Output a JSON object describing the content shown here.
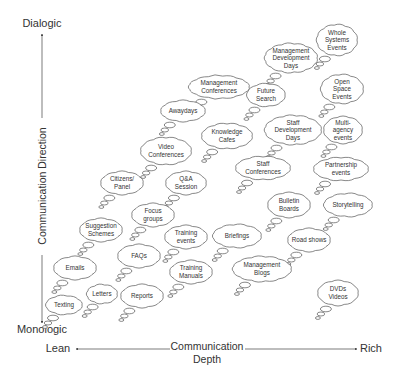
{
  "y_axis": {
    "top_label": "Dialogic",
    "bottom_label": "Monologic",
    "title": "Communication Direction"
  },
  "x_axis": {
    "left_label": "Lean",
    "right_label": "Rich",
    "title_line1": "Communication",
    "title_line2": "Depth"
  },
  "clouds": [
    {
      "id": "whole-systems-events",
      "lines": [
        "Whole",
        "Systems",
        "Events"
      ]
    },
    {
      "id": "management-development-days",
      "lines": [
        "Management",
        "Development",
        "Days"
      ]
    },
    {
      "id": "management-conferences",
      "lines": [
        "Management",
        "Conferences"
      ]
    },
    {
      "id": "open-space-events",
      "lines": [
        "Open",
        "Space",
        "Events"
      ]
    },
    {
      "id": "future-search",
      "lines": [
        "Future",
        "Search"
      ]
    },
    {
      "id": "awaydays",
      "lines": [
        "Awaydays"
      ]
    },
    {
      "id": "knowledge-cafes",
      "lines": [
        "Knowledge",
        "Cafes"
      ]
    },
    {
      "id": "staff-development-days",
      "lines": [
        "Staff",
        "Development",
        "Days"
      ]
    },
    {
      "id": "multi-agency-events",
      "lines": [
        "Multi-",
        "agency",
        "events"
      ]
    },
    {
      "id": "video-conferences",
      "lines": [
        "Video",
        "Conferences"
      ]
    },
    {
      "id": "staff-conferences",
      "lines": [
        "Staff",
        "Conferences"
      ]
    },
    {
      "id": "partnership-events",
      "lines": [
        "Partnership",
        "events"
      ]
    },
    {
      "id": "citizens-panel",
      "lines": [
        "Citizens/",
        "Panel"
      ]
    },
    {
      "id": "qa-session",
      "lines": [
        "Q&A",
        "Session"
      ]
    },
    {
      "id": "focus-groups",
      "lines": [
        "Focus",
        "groups"
      ]
    },
    {
      "id": "bulletin-boards",
      "lines": [
        "Bulletin",
        "Boards"
      ]
    },
    {
      "id": "storytelling",
      "lines": [
        "Storytelling"
      ]
    },
    {
      "id": "suggestion-schemes",
      "lines": [
        "Suggestion",
        "Schemes"
      ]
    },
    {
      "id": "training-events",
      "lines": [
        "Training",
        "events"
      ]
    },
    {
      "id": "briefings",
      "lines": [
        "Briefings"
      ]
    },
    {
      "id": "road-shows",
      "lines": [
        "Road shows"
      ]
    },
    {
      "id": "faqs",
      "lines": [
        "FAQs"
      ]
    },
    {
      "id": "emails",
      "lines": [
        "Emails"
      ]
    },
    {
      "id": "training-manuals",
      "lines": [
        "Training",
        "Manuals"
      ]
    },
    {
      "id": "management-blogs",
      "lines": [
        "Management",
        "Blogs"
      ]
    },
    {
      "id": "letters",
      "lines": [
        "Letters"
      ]
    },
    {
      "id": "reports",
      "lines": [
        "Reports"
      ]
    },
    {
      "id": "texting",
      "lines": [
        "Texting"
      ]
    },
    {
      "id": "dvds-videos",
      "lines": [
        "DVDs",
        "Videos"
      ]
    }
  ]
}
